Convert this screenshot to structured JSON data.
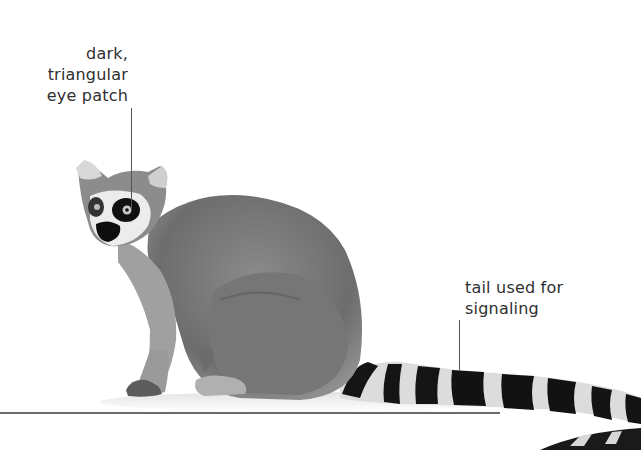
{
  "labels": {
    "eye_patch": [
      "dark,",
      "triangular",
      "eye patch"
    ],
    "tail": [
      "tail used for",
      "signaling"
    ]
  },
  "colors": {
    "background": "#ffffff",
    "text": "#2f2f2f",
    "fur": "#7a7a7a",
    "tail_dark": "#141414",
    "tail_light": "#e6e6e6"
  }
}
